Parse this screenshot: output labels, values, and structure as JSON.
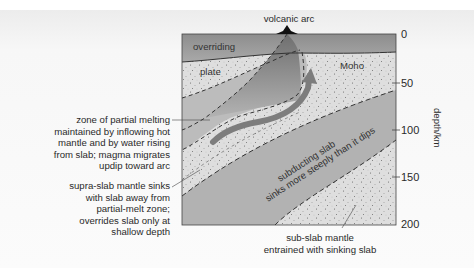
{
  "page": {
    "cropped_top_text": "…nearly the same as the topography… the slab sinks … of the slab surface (dip) …"
  },
  "diagram": {
    "title_label": "volcanic arc",
    "regions": {
      "overriding_plate_line1": "overriding",
      "overriding_plate_line2": "plate",
      "moho": "Moho",
      "subducting_slab_line1": "subducting slab",
      "subducting_slab_line2": "sinks more steeply than it dips"
    },
    "annotations": [
      {
        "id": "partial-melting",
        "lines": [
          "zone of partial melting",
          "maintained by inflowing hot",
          "mantle and by water rising",
          "from slab; magma migrates",
          "updip toward arc"
        ]
      },
      {
        "id": "supra-slab",
        "lines": [
          "supra-slab mantle sinks",
          "with slab away from",
          "partial-melt zone;",
          "overrides slab only at",
          "shallow depth"
        ]
      },
      {
        "id": "sub-slab",
        "lines": [
          "sub-slab mantle",
          "entrained with sinking slab"
        ]
      }
    ],
    "depth_axis": {
      "title": "depth/km",
      "ticks": [
        "0",
        "50",
        "100",
        "150",
        "200"
      ],
      "range": [
        0,
        200
      ]
    },
    "colors": {
      "overriding_plate": "#9a9a9a",
      "mantle_light": "#dcdcdc",
      "slab": "#b4b4b4",
      "melt_zone": "#8e8e8e",
      "arrow": "#7c7c7c",
      "line": "#333333"
    }
  }
}
